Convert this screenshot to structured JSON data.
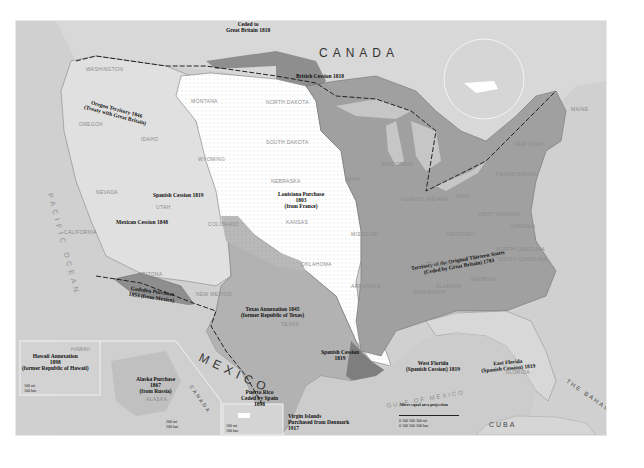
{
  "map": {
    "title_labels": {
      "canada": "CANADA",
      "mexico": "MEXICO",
      "cuba": "CUBA",
      "bahamas": "THE BAHAMAS",
      "canada_small": "CANADA",
      "pacific_ocean": "PACIFIC OCEAN",
      "atlantic_ocean": "ATLANTIC OCEAN",
      "gulf_of_mexico": "GULF OF MEXICO"
    },
    "acquisitions": [
      {
        "id": "ceded-gb-1818",
        "line1": "Ceded to",
        "line2": "Great Britain 1818"
      },
      {
        "id": "british-cession",
        "line1": "British Cession 1818"
      },
      {
        "id": "oregon",
        "line1": "Oregon Territory 1846",
        "line2": "(Treaty with Great Britain)"
      },
      {
        "id": "louisiana",
        "line1": "Louisiana Purchase",
        "line2": "1803",
        "line3": "(from France)"
      },
      {
        "id": "spanish-cession-west",
        "line1": "Spanish Cession 1819"
      },
      {
        "id": "mexican-cession",
        "line1": "Mexican Cession 1848"
      },
      {
        "id": "gadsden",
        "line1": "Gadsden Purchase",
        "line2": "1853 (from Mexico)"
      },
      {
        "id": "texas",
        "line1": "Texas Annexation 1845",
        "line2": "(former Republic of Texas)"
      },
      {
        "id": "spanish-cession-south",
        "line1": "Spanish Cession",
        "line2": "1819"
      },
      {
        "id": "thirteen-states",
        "line1": "Territory of the Original Thirteen States",
        "line2": "(Ceded by Great Britain) 1783"
      },
      {
        "id": "west-florida",
        "line1": "West Florida",
        "line2": "(Spanish Cession) 1819"
      },
      {
        "id": "east-florida",
        "line1": "East Florida",
        "line2": "(Spanish Cession) 1819"
      },
      {
        "id": "hawaii",
        "line1": "Hawaii Annexation",
        "line2": "1898",
        "line3": "(former Republic of Hawaii)"
      },
      {
        "id": "alaska",
        "line1": "Alaska Purchase",
        "line2": "1867",
        "line3": "(from Russia)"
      },
      {
        "id": "puerto-rico",
        "line1": "Puerto Rico",
        "line2": "Ceded by Spain",
        "line3": "1898"
      },
      {
        "id": "virgin-islands",
        "line1": "Virgin Islands",
        "line2": "Purchased from Denmark",
        "line3": "1917"
      }
    ],
    "states": {
      "washington": "WASHINGTON",
      "oregon": "OREGON",
      "idaho": "IDAHO",
      "montana": "MONTANA",
      "wyoming": "WYOMING",
      "nevada": "NEVADA",
      "utah": "UTAH",
      "california": "CALIFORNIA",
      "arizona": "ARIZONA",
      "new_mexico": "NEW MEXICO",
      "colorado": "COLORADO",
      "north_dakota": "NORTH DAKOTA",
      "south_dakota": "SOUTH DAKOTA",
      "nebraska": "NEBRASKA",
      "kansas": "KANSAS",
      "oklahoma": "OKLAHOMA",
      "texas": "TEXAS",
      "iowa": "IOWA",
      "missouri": "MISSOURI",
      "arkansas": "ARKANSAS",
      "louisiana": "LOUISIANA",
      "minnesota": "MINNESOTA",
      "wisconsin": "WISCONSIN",
      "michigan": "MICHIGAN",
      "illinois": "ILLINOIS",
      "indiana": "INDIANA",
      "ohio": "OHIO",
      "kentucky": "KENTUCKY",
      "tennessee": "TENNESSEE",
      "mississippi": "MISSISSIPPI",
      "alabama": "ALABAMA",
      "georgia": "GEORGIA",
      "florida": "FLORIDA",
      "south_carolina": "SOUTH CAROLINA",
      "north_carolina": "NORTH CAROLINA",
      "virginia": "VIRGINIA",
      "west_virginia": "WEST VIRGINIA",
      "pennsylvania": "PENNSYLVANIA",
      "new_york": "NEW YORK",
      "maine": "MAINE",
      "hawaii": "HAWAII",
      "alaska": "ALASKA"
    },
    "scale": {
      "projection": "Albers equal area projection",
      "miles": [
        "0",
        "100",
        "200",
        "300 mi"
      ],
      "km": [
        "0",
        "100",
        "200",
        "300 km"
      ],
      "hawaii_mi": "100 mi",
      "hawaii_km": "100 km",
      "alaska_mi": "200 mi",
      "alaska_km": "200 km",
      "pr_mi": "100 mi",
      "pr_km": "100 km"
    },
    "colors": {
      "background_land": "#dcdcdc",
      "water": "#d0d0d0",
      "louisiana_purchase": "#ffffff",
      "original_states": "#9e9e9e",
      "texas_annexation": "#b4b4b4",
      "mexican_cession": "#dedede",
      "cessions_dark": "#8a8a8a"
    }
  }
}
